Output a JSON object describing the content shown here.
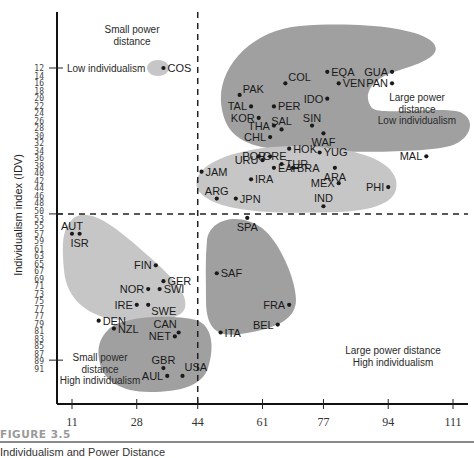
{
  "chart_data": {
    "type": "scatter",
    "title": "",
    "figure_label": "FIGURE 3.5",
    "caption": "Individualism and Power Distance",
    "xlabel": "",
    "ylabel": "Individualism index (IDV)",
    "x_ticks": [
      11,
      28,
      44,
      61,
      77,
      94,
      111
    ],
    "xlim": [
      11,
      111
    ],
    "y_ticks": [
      12,
      14,
      16,
      18,
      20,
      22,
      24,
      26,
      28,
      30,
      32,
      34,
      36,
      38,
      40,
      42,
      44,
      46,
      48,
      50,
      53,
      55,
      57,
      59,
      61,
      63,
      65,
      67,
      69,
      71,
      73,
      75,
      77,
      77,
      79,
      81,
      83,
      85,
      87,
      89,
      91
    ],
    "y_marked_ticks": [
      12,
      50,
      87
    ],
    "ylim": [
      12,
      91
    ],
    "y_inverted": true,
    "dividers": {
      "x": 44,
      "y": 50
    },
    "quadrant_labels": [
      {
        "text": [
          "Small power",
          "distance"
        ],
        "pos": "top-left"
      },
      {
        "text": [
          "Large power",
          "distance",
          "Low individualism"
        ],
        "pos": "top-right"
      },
      {
        "text": [
          "Small power",
          "distance",
          "High individualism"
        ],
        "pos": "bottom-left"
      },
      {
        "text": [
          "Large power distance",
          "High individualism"
        ],
        "pos": "bottom-right"
      }
    ],
    "axis_annotation": {
      "text": "Low individualism",
      "y": 12
    },
    "clusters": [
      {
        "name": "cos-cluster",
        "shade": "light",
        "members": [
          "COS"
        ]
      },
      {
        "name": "large-pd-low-idv-cluster",
        "shade": "dark",
        "members": [
          "PAK",
          "COL",
          "EQA",
          "GUA",
          "VEN",
          "PAN",
          "IDO",
          "TAL",
          "PER",
          "KOR",
          "SAL",
          "SIN",
          "THA",
          "WAF",
          "CHL",
          "HOK",
          "YUG",
          "POR",
          "EAF",
          "MEX",
          "PHI",
          "MAL"
        ]
      },
      {
        "name": "middle-cluster",
        "shade": "light",
        "members": [
          "GRE",
          "URU",
          "TUR",
          "JAM",
          "IRA",
          "BRA",
          "ARA",
          "ARG",
          "JPN",
          "IND"
        ]
      },
      {
        "name": "small-pd-nordic-cluster",
        "shade": "light",
        "members": [
          "AUT",
          "ISR",
          "FIN",
          "GER",
          "NOR",
          "SWI",
          "IRE",
          "SWE",
          "DEN"
        ]
      },
      {
        "name": "latin-europe-cluster",
        "shade": "dark",
        "members": [
          "SPA",
          "SAF",
          "FRA",
          "BEL",
          "ITA"
        ]
      },
      {
        "name": "anglo-cluster",
        "shade": "dark",
        "members": [
          "NZL",
          "CAN",
          "NET",
          "GBR",
          "USA",
          "AUL"
        ]
      }
    ],
    "points": [
      {
        "label": "COS",
        "x": 35,
        "y": 12,
        "side": "right"
      },
      {
        "label": "PAK",
        "x": 55,
        "y": 19,
        "side": "right-up"
      },
      {
        "label": "COL",
        "x": 67,
        "y": 16,
        "side": "right-up"
      },
      {
        "label": "EQA",
        "x": 78,
        "y": 13,
        "side": "right"
      },
      {
        "label": "GUA",
        "x": 95,
        "y": 13,
        "side": "left"
      },
      {
        "label": "VEN",
        "x": 81,
        "y": 16,
        "side": "right"
      },
      {
        "label": "PAN",
        "x": 95,
        "y": 16,
        "side": "left"
      },
      {
        "label": "IDO",
        "x": 78,
        "y": 20,
        "side": "left"
      },
      {
        "label": "TAL",
        "x": 58,
        "y": 22,
        "side": "left"
      },
      {
        "label": "PER",
        "x": 64,
        "y": 22,
        "side": "right"
      },
      {
        "label": "KOR",
        "x": 60,
        "y": 25,
        "side": "left"
      },
      {
        "label": "SAL",
        "x": 66,
        "y": 28,
        "side": "up"
      },
      {
        "label": "SIN",
        "x": 74,
        "y": 27,
        "side": "up"
      },
      {
        "label": "THA",
        "x": 64,
        "y": 27,
        "side": "left"
      },
      {
        "label": "WAF",
        "x": 77,
        "y": 29,
        "side": "down"
      },
      {
        "label": "CHL",
        "x": 63,
        "y": 30,
        "side": "left"
      },
      {
        "label": "HOK",
        "x": 68,
        "y": 33,
        "side": "right"
      },
      {
        "label": "YUG",
        "x": 76,
        "y": 34,
        "side": "right"
      },
      {
        "label": "POR",
        "x": 63,
        "y": 35,
        "side": "left"
      },
      {
        "label": "EAF",
        "x": 64,
        "y": 38,
        "side": "right"
      },
      {
        "label": "MEX",
        "x": 81,
        "y": 42,
        "side": "left"
      },
      {
        "label": "PHI",
        "x": 94,
        "y": 43,
        "side": "left"
      },
      {
        "label": "MAL",
        "x": 104,
        "y": 35,
        "side": "left"
      },
      {
        "label": "GRE",
        "x": 60,
        "y": 35,
        "side": "right"
      },
      {
        "label": "URU",
        "x": 61,
        "y": 36,
        "side": "left"
      },
      {
        "label": "TUR",
        "x": 66,
        "y": 37,
        "side": "right"
      },
      {
        "label": "JAM",
        "x": 45,
        "y": 39,
        "side": "right"
      },
      {
        "label": "IRA",
        "x": 58,
        "y": 41,
        "side": "right"
      },
      {
        "label": "BRA",
        "x": 69,
        "y": 38,
        "side": "right"
      },
      {
        "label": "ARA",
        "x": 80,
        "y": 38,
        "side": "down"
      },
      {
        "label": "ARG",
        "x": 49,
        "y": 46,
        "side": "up"
      },
      {
        "label": "JPN",
        "x": 54,
        "y": 46,
        "side": "right"
      },
      {
        "label": "IND",
        "x": 77,
        "y": 48,
        "side": "up"
      },
      {
        "label": "AUT",
        "x": 11,
        "y": 55,
        "side": "up"
      },
      {
        "label": "ISR",
        "x": 13,
        "y": 55,
        "side": "down"
      },
      {
        "label": "FIN",
        "x": 33,
        "y": 63,
        "side": "left"
      },
      {
        "label": "GER",
        "x": 35,
        "y": 67,
        "side": "right"
      },
      {
        "label": "NOR",
        "x": 31,
        "y": 69,
        "side": "left"
      },
      {
        "label": "SWI",
        "x": 34,
        "y": 69,
        "side": "right"
      },
      {
        "label": "IRE",
        "x": 28,
        "y": 73,
        "side": "left"
      },
      {
        "label": "SWE",
        "x": 31,
        "y": 73,
        "side": "right-down"
      },
      {
        "label": "DEN",
        "x": 18,
        "y": 77,
        "side": "right"
      },
      {
        "label": "NZL",
        "x": 22,
        "y": 79,
        "side": "right"
      },
      {
        "label": "CAN",
        "x": 39,
        "y": 80,
        "side": "up-left"
      },
      {
        "label": "NET",
        "x": 38,
        "y": 81,
        "side": "left"
      },
      {
        "label": "GBR",
        "x": 35,
        "y": 89,
        "side": "up"
      },
      {
        "label": "USA",
        "x": 40,
        "y": 91,
        "side": "up-right"
      },
      {
        "label": "AUL",
        "x": 36,
        "y": 91,
        "side": "left"
      },
      {
        "label": "SPA",
        "x": 57,
        "y": 51,
        "side": "down"
      },
      {
        "label": "SAF",
        "x": 49,
        "y": 65,
        "side": "right"
      },
      {
        "label": "FRA",
        "x": 68,
        "y": 73,
        "side": "left"
      },
      {
        "label": "BEL",
        "x": 65,
        "y": 78,
        "side": "left"
      },
      {
        "label": "ITA",
        "x": 50,
        "y": 80,
        "side": "right"
      }
    ],
    "colors": {
      "dark_shade": "#a0a0a0",
      "light_shade": "#c6c6c6",
      "ink": "#1a1a1a"
    }
  }
}
